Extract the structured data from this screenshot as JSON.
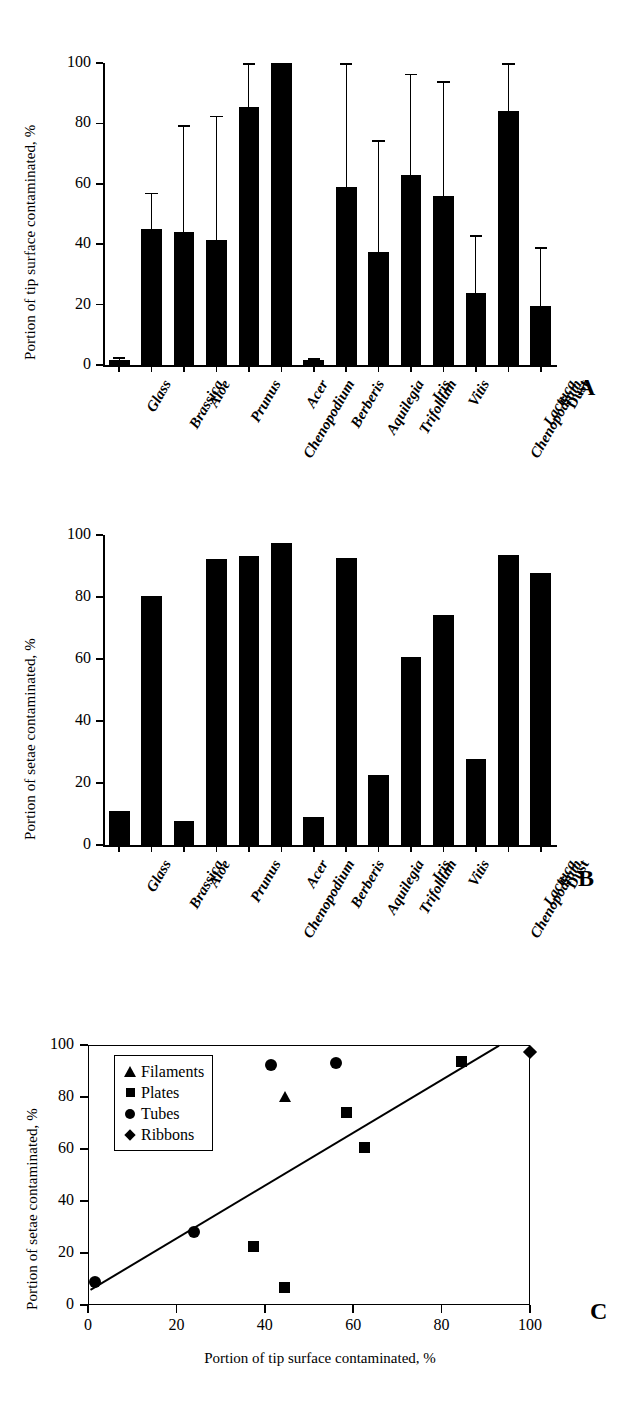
{
  "figure": {
    "panels": [
      "A",
      "B",
      "C"
    ]
  },
  "chart_data": [
    {
      "panel": "A",
      "type": "bar",
      "title": "",
      "xlabel": "",
      "ylabel": "Portion of tip surface contaminated, %",
      "ylim": [
        0,
        100
      ],
      "yticks": [
        0,
        20,
        40,
        60,
        80,
        100
      ],
      "grid": false,
      "errorbars": "upper only",
      "categories": [
        "Glass",
        "Brassica",
        "Aloe",
        "Prunus",
        "Chenopodium",
        "Acer",
        "Berberis",
        "Aquilegia",
        "Trifolium",
        "Iris",
        "Vitis",
        "Chenopodium",
        "Lactuca",
        "Dust"
      ],
      "categories_italic": [
        true,
        true,
        true,
        true,
        true,
        true,
        true,
        true,
        true,
        true,
        true,
        true,
        true,
        false
      ],
      "values": [
        1.5,
        45.0,
        44.0,
        41.5,
        85.5,
        100.0,
        1.5,
        59.0,
        37.5,
        63.0,
        56.0,
        24.0,
        84.0,
        19.5
      ],
      "errors_upper": [
        2.5,
        57.0,
        79.5,
        82.5,
        100.0,
        100.0,
        2.2,
        100.0,
        74.5,
        96.5,
        94.0,
        43.0,
        100.0,
        39.0
      ]
    },
    {
      "panel": "B",
      "type": "bar",
      "title": "",
      "xlabel": "",
      "ylabel": "Portion of setae contaminated, %",
      "ylim": [
        0,
        100
      ],
      "yticks": [
        0,
        20,
        40,
        60,
        80,
        100
      ],
      "grid": false,
      "errorbars": "none",
      "categories": [
        "Glass",
        "Brassica",
        "Aloe",
        "Prunus",
        "Chenopodium",
        "Acer",
        "Berberis",
        "Aquilegia",
        "Trifolium",
        "Iris",
        "Vitis",
        "Chenopodium",
        "Lactuca",
        "Dust"
      ],
      "categories_italic": [
        true,
        true,
        true,
        true,
        true,
        true,
        true,
        true,
        true,
        true,
        true,
        true,
        true,
        false
      ],
      "values": [
        11.0,
        80.3,
        7.7,
        92.2,
        93.3,
        97.4,
        8.9,
        92.6,
        22.7,
        60.7,
        74.2,
        27.9,
        93.7,
        87.6
      ]
    },
    {
      "panel": "C",
      "type": "scatter",
      "title": "",
      "xlabel": "Portion of tip surface contaminated, %",
      "ylabel": "Portion of setae contaminated, %",
      "xlim": [
        0,
        100
      ],
      "ylim": [
        0,
        100
      ],
      "xticks": [
        0,
        20,
        40,
        60,
        80,
        100
      ],
      "yticks": [
        0,
        20,
        40,
        60,
        80,
        100
      ],
      "grid": false,
      "legend_position": "top-left",
      "series": [
        {
          "name": "Filaments",
          "marker": "triangle",
          "points": [
            {
              "x": 44.5,
              "y": 79.5
            }
          ]
        },
        {
          "name": "Plates",
          "marker": "square",
          "points": [
            {
              "x": 37.5,
              "y": 22.5
            },
            {
              "x": 44.5,
              "y": 6.8
            },
            {
              "x": 58.5,
              "y": 74.2
            },
            {
              "x": 62.5,
              "y": 60.7
            },
            {
              "x": 84.5,
              "y": 93.7
            }
          ]
        },
        {
          "name": "Tubes",
          "marker": "circle",
          "points": [
            {
              "x": 1.5,
              "y": 8.8
            },
            {
              "x": 24.0,
              "y": 27.9
            },
            {
              "x": 41.5,
              "y": 92.2
            },
            {
              "x": 56.0,
              "y": 92.9
            }
          ]
        },
        {
          "name": "Ribbons",
          "marker": "diamond",
          "points": [
            {
              "x": 100.0,
              "y": 97.4
            }
          ]
        }
      ],
      "trendline": {
        "x0": 0.5,
        "y0": 6.0,
        "x1": 93.0,
        "y1": 100.0
      }
    }
  ]
}
